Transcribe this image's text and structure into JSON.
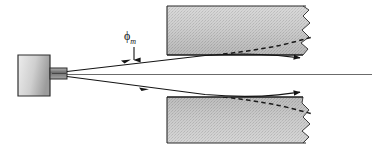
{
  "figure": {
    "type": "optics-ray-diagram",
    "title": "",
    "canvas": {
      "width": 377,
      "height": 149,
      "background": "#ffffff"
    },
    "labels": {
      "acceptance_angle": {
        "symbol": "ϕ",
        "subscript": "m",
        "x": 128,
        "y": 33
      }
    },
    "colors": {
      "stroke": "#1a1a1a",
      "block_light": "#d9d9d9",
      "block_mid": "#c2c2c2",
      "block_dark": "#a8a8a8",
      "source_light": "#e2e2e2",
      "source_dark": "#9a9a9a",
      "axis": "#4a4a4a"
    },
    "source": {
      "name": "emitter-body",
      "x": 18,
      "y": 55,
      "width": 32,
      "height": 40,
      "neck": {
        "x": 50,
        "y": 68,
        "width": 17,
        "height": 11
      }
    },
    "blocks": {
      "upper": {
        "x": 167,
        "y": 6,
        "width": 146,
        "height": 49
      },
      "lower": {
        "x": 167,
        "y": 97,
        "width": 146,
        "height": 46
      }
    },
    "axis_line": {
      "x1": 67,
      "y1": 74,
      "x2": 372,
      "y2": 74
    },
    "rays": {
      "upper": {
        "start_x": 67,
        "start_y": 72,
        "apex_x": 216,
        "apex_y": 55,
        "end_x": 303,
        "end_y": 58
      },
      "lower": {
        "start_x": 67,
        "start_y": 76,
        "apex_x": 216,
        "apex_y": 95,
        "end_x": 303,
        "end_y": 92
      }
    },
    "dashed_curves": {
      "upper": {
        "from_x": 216,
        "from_y": 56,
        "to_x": 313,
        "to_y": 40
      },
      "lower": {
        "from_x": 216,
        "from_y": 94,
        "to_x": 313,
        "to_y": 110
      }
    },
    "break_line": {
      "name": "jagged-break",
      "x": 306,
      "top_y": 6,
      "bottom_y": 143
    }
  }
}
